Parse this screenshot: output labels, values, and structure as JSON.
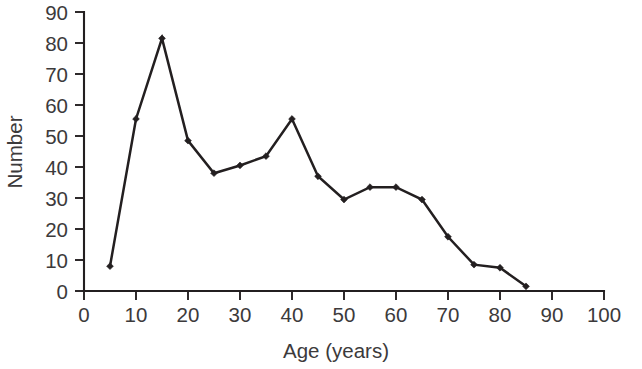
{
  "chart_data": {
    "type": "line",
    "title": "",
    "xlabel": "Age (years)",
    "ylabel": "Number",
    "xlim": [
      0,
      100
    ],
    "ylim": [
      0,
      90
    ],
    "xticks": [
      0,
      10,
      20,
      30,
      40,
      50,
      60,
      70,
      80,
      90,
      100
    ],
    "xtick_labels": [
      "0",
      "10",
      "20",
      "30",
      "40",
      "50",
      "60",
      "70",
      "80",
      "90",
      "100"
    ],
    "yticks": [
      0,
      10,
      20,
      30,
      40,
      50,
      60,
      70,
      80,
      90
    ],
    "ytick_labels": [
      "0",
      "10",
      "20",
      "30",
      "40",
      "50",
      "60",
      "70",
      "80",
      "90"
    ],
    "grid": false,
    "legend": null,
    "marker": "diamond",
    "line_color": "#231f20",
    "x": [
      5,
      10,
      15,
      20,
      25,
      30,
      35,
      40,
      45,
      50,
      55,
      60,
      65,
      70,
      75,
      80,
      85
    ],
    "values": [
      8,
      55.5,
      81.5,
      48.5,
      38,
      40.5,
      43.5,
      55.5,
      37,
      29.5,
      33.5,
      33.5,
      29.5,
      17.5,
      8.5,
      7.5,
      1.5
    ],
    "series": [
      {
        "name": "Number",
        "x": [
          5,
          10,
          15,
          20,
          25,
          30,
          35,
          40,
          45,
          50,
          55,
          60,
          65,
          70,
          75,
          80,
          85
        ],
        "values": [
          8,
          55.5,
          81.5,
          48.5,
          38,
          40.5,
          43.5,
          55.5,
          37,
          29.5,
          33.5,
          33.5,
          29.5,
          17.5,
          8.5,
          7.5,
          1.5
        ]
      }
    ]
  }
}
